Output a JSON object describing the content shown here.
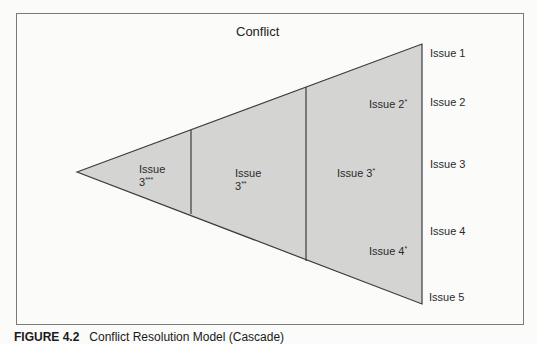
{
  "diagram": {
    "title": "Conflict",
    "colors": {
      "fill": "#d4d4d3",
      "stroke": "#3c3c3c",
      "frame": "#7a7a7a",
      "background": "#fbfbfa"
    },
    "sections": [
      {
        "label_line1": "Issue",
        "label_line2": "3",
        "mark": "***"
      },
      {
        "label_line1": "Issue",
        "label_line2": "3",
        "mark": "**"
      },
      {
        "label": "Issue 3",
        "mark": "*"
      },
      {
        "label": "Issue 2",
        "mark": "*"
      },
      {
        "label": "Issue 4",
        "mark": "*"
      }
    ],
    "right_labels": [
      "Issue 1",
      "Issue 2",
      "Issue 3",
      "Issue 4",
      "Issue 5"
    ]
  },
  "caption": {
    "number": "FIGURE 4.2",
    "text": "Conflict Resolution Model (Cascade)"
  }
}
